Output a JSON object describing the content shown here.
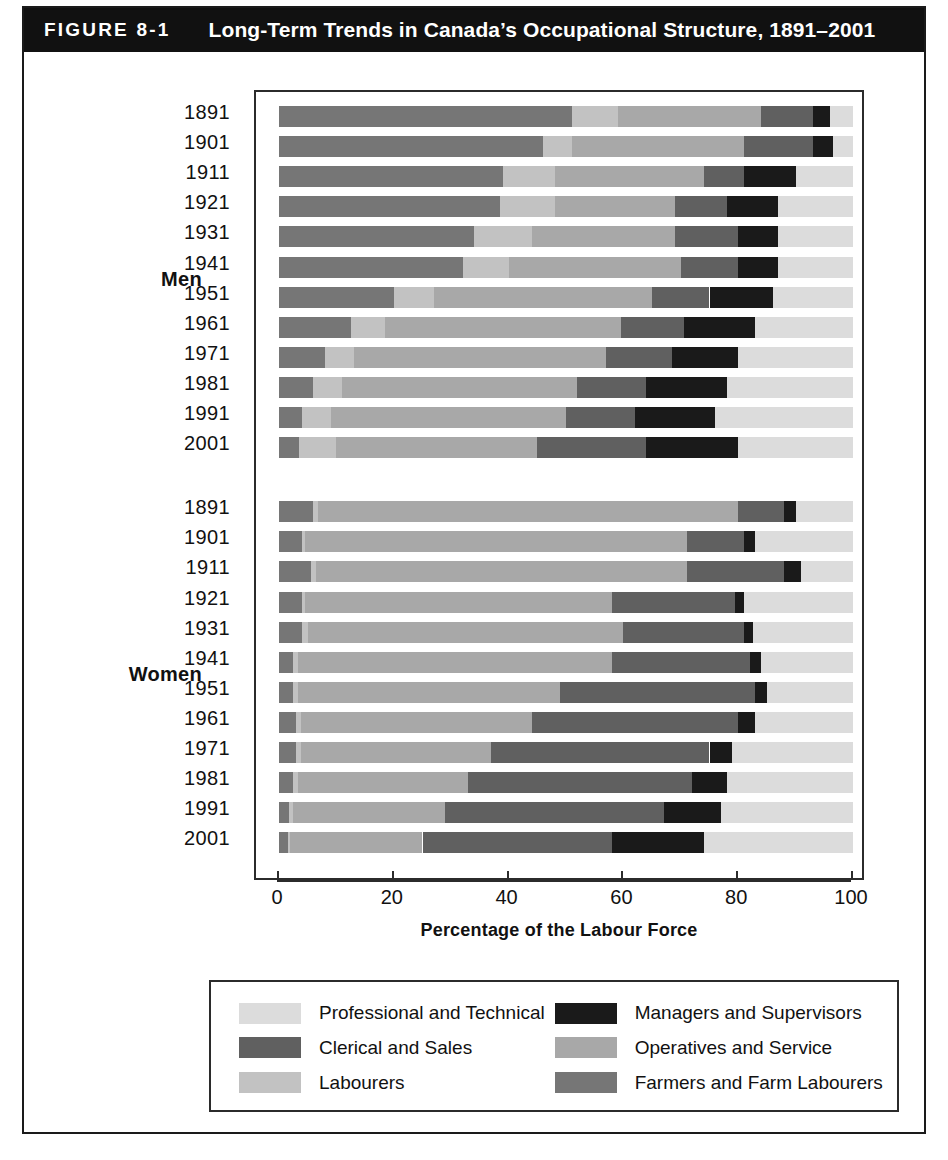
{
  "figure": {
    "number": "FIGURE 8-1",
    "title": "Long-Term Trends in Canada’s Occupational Structure, 1891–2001"
  },
  "axis": {
    "x_title": "Percentage of the Labour Force",
    "ticks": [
      "0",
      "20",
      "40",
      "60",
      "80",
      "100"
    ]
  },
  "groups": {
    "men_label": "Men",
    "women_label": "Women"
  },
  "legend": {
    "items": [
      {
        "label": "Professional and Technical",
        "color": "#dcdcdc",
        "key": "professional"
      },
      {
        "label": "Managers and Supervisors",
        "color": "#1a1a1a",
        "key": "managers"
      },
      {
        "label": "Clerical and Sales",
        "color": "#606060",
        "key": "clerical"
      },
      {
        "label": "Operatives and Service",
        "color": "#a8a8a8",
        "key": "operatives"
      },
      {
        "label": "Labourers",
        "color": "#c2c2c2",
        "key": "labourers"
      },
      {
        "label": "Farmers and Farm Labourers",
        "color": "#767676",
        "key": "farmers"
      }
    ]
  },
  "source_note": "",
  "chart_data": {
    "type": "bar",
    "orientation": "horizontal",
    "stacked": true,
    "title": "Long-Term Trends in Canada’s Occupational Structure, 1891–2001",
    "xlabel": "Percentage of the Labour Force",
    "ylabel": "",
    "xlim": [
      0,
      100
    ],
    "grid": false,
    "legend_position": "bottom",
    "segment_order": [
      "farmers",
      "labourers",
      "operatives",
      "clerical",
      "managers",
      "professional"
    ],
    "segment_colors": {
      "farmers": "#767676",
      "labourers": "#c2c2c2",
      "operatives": "#a8a8a8",
      "clerical": "#606060",
      "managers": "#1a1a1a",
      "professional": "#dcdcdc"
    },
    "panels": [
      {
        "name": "Men",
        "categories": [
          "1891",
          "1901",
          "1911",
          "1921",
          "1931",
          "1941",
          "1951",
          "1961",
          "1971",
          "1981",
          "1991",
          "2001"
        ],
        "rows": [
          {
            "year": "1891",
            "farmers": 51.0,
            "labourers": 8.0,
            "operatives": 25.0,
            "clerical": 9.0,
            "managers": 3.0,
            "professional": 4.0
          },
          {
            "year": "1901",
            "farmers": 46.0,
            "labourers": 5.0,
            "operatives": 30.0,
            "clerical": 12.0,
            "managers": 3.5,
            "professional": 3.5
          },
          {
            "year": "1911",
            "farmers": 39.0,
            "labourers": 9.0,
            "operatives": 26.0,
            "clerical": 7.0,
            "managers": 9.0,
            "professional": 10.0
          },
          {
            "year": "1921",
            "farmers": 38.5,
            "labourers": 9.5,
            "operatives": 21.0,
            "clerical": 9.0,
            "managers": 9.0,
            "professional": 13.0
          },
          {
            "year": "1931",
            "farmers": 34.0,
            "labourers": 10.0,
            "operatives": 25.0,
            "clerical": 11.0,
            "managers": 7.0,
            "professional": 13.0
          },
          {
            "year": "1941",
            "farmers": 32.0,
            "labourers": 8.0,
            "operatives": 30.0,
            "clerical": 10.0,
            "managers": 7.0,
            "professional": 13.0
          },
          {
            "year": "1951",
            "farmers": 20.0,
            "labourers": 7.0,
            "operatives": 38.0,
            "clerical": 10.0,
            "managers": 11.0,
            "professional": 14.0
          },
          {
            "year": "1961",
            "farmers": 12.5,
            "labourers": 6.0,
            "operatives": 41.0,
            "clerical": 11.0,
            "managers": 12.5,
            "professional": 17.0
          },
          {
            "year": "1971",
            "farmers": 8.0,
            "labourers": 5.0,
            "operatives": 44.0,
            "clerical": 11.5,
            "managers": 11.5,
            "professional": 20.0
          },
          {
            "year": "1981",
            "farmers": 6.0,
            "labourers": 5.0,
            "operatives": 41.0,
            "clerical": 12.0,
            "managers": 14.0,
            "professional": 22.0
          },
          {
            "year": "1991",
            "farmers": 4.0,
            "labourers": 5.0,
            "operatives": 41.0,
            "clerical": 12.0,
            "managers": 14.0,
            "professional": 24.0
          },
          {
            "year": "2001",
            "farmers": 3.5,
            "labourers": 6.5,
            "operatives": 35.0,
            "clerical": 19.0,
            "managers": 16.0,
            "professional": 20.0
          }
        ]
      },
      {
        "name": "Women",
        "categories": [
          "1891",
          "1901",
          "1911",
          "1921",
          "1931",
          "1941",
          "1951",
          "1961",
          "1971",
          "1981",
          "1991",
          "2001"
        ],
        "rows": [
          {
            "year": "1891",
            "farmers": 6.0,
            "labourers": 0.8,
            "operatives": 73.2,
            "clerical": 8.0,
            "managers": 2.0,
            "professional": 10.0
          },
          {
            "year": "1901",
            "farmers": 4.0,
            "labourers": 0.5,
            "operatives": 66.5,
            "clerical": 10.0,
            "managers": 2.0,
            "professional": 17.0
          },
          {
            "year": "1911",
            "farmers": 5.5,
            "labourers": 1.0,
            "operatives": 64.5,
            "clerical": 17.0,
            "managers": 3.0,
            "professional": 9.0
          },
          {
            "year": "1921",
            "farmers": 4.0,
            "labourers": 0.5,
            "operatives": 53.5,
            "clerical": 21.5,
            "managers": 1.5,
            "professional": 19.0
          },
          {
            "year": "1931",
            "farmers": 4.0,
            "labourers": 1.0,
            "operatives": 55.0,
            "clerical": 21.0,
            "managers": 1.5,
            "professional": 17.5
          },
          {
            "year": "1941",
            "farmers": 2.5,
            "labourers": 0.8,
            "operatives": 54.7,
            "clerical": 24.0,
            "managers": 2.0,
            "professional": 16.0
          },
          {
            "year": "1951",
            "farmers": 2.5,
            "labourers": 0.8,
            "operatives": 45.7,
            "clerical": 34.0,
            "managers": 2.0,
            "professional": 15.0
          },
          {
            "year": "1961",
            "farmers": 3.0,
            "labourers": 0.8,
            "operatives": 40.2,
            "clerical": 36.0,
            "managers": 3.0,
            "professional": 17.0
          },
          {
            "year": "1971",
            "farmers": 3.0,
            "labourers": 0.8,
            "operatives": 33.2,
            "clerical": 38.0,
            "managers": 4.0,
            "professional": 21.0
          },
          {
            "year": "1981",
            "farmers": 2.5,
            "labourers": 0.8,
            "operatives": 29.7,
            "clerical": 39.0,
            "managers": 6.0,
            "professional": 22.0
          },
          {
            "year": "1991",
            "farmers": 1.8,
            "labourers": 0.7,
            "operatives": 26.5,
            "clerical": 38.0,
            "managers": 10.0,
            "professional": 23.0
          },
          {
            "year": "2001",
            "farmers": 1.5,
            "labourers": 0.5,
            "operatives": 23.0,
            "clerical": 33.0,
            "managers": 16.0,
            "professional": 26.0
          }
        ]
      }
    ]
  }
}
